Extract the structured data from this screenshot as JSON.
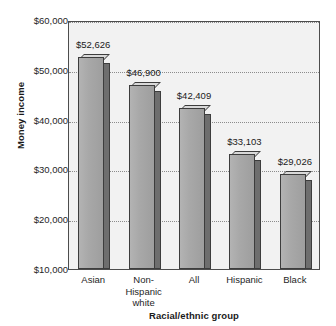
{
  "chart_data": {
    "type": "bar",
    "title": "",
    "subtitle": "",
    "xlabel": "Racial/ethnic group",
    "ylabel": "Money income",
    "categories": [
      "Asian",
      "Non-\nHispanic\nwhite",
      "All",
      "Hispanic",
      "Black"
    ],
    "category_labels_flat": [
      "Asian",
      "Non-Hispanic white",
      "All",
      "Hispanic",
      "Black"
    ],
    "values": [
      52626,
      46900,
      42409,
      33103,
      29026
    ],
    "data_labels": [
      "$52,626",
      "$46,900",
      "$42,409",
      "$33,103",
      "$29,026"
    ],
    "ylim": [
      10000,
      60000
    ],
    "ytick_values": [
      10000,
      20000,
      30000,
      40000,
      50000,
      60000
    ],
    "ytick_labels": [
      "$10,000",
      "$20,000",
      "$30,000",
      "$40,000",
      "$50,000",
      "$60,000"
    ],
    "grid": true,
    "grid_style": "dotted",
    "legend": "none",
    "bar_style": "3d",
    "colors": {
      "bar_front": "#a8a8a8",
      "bar_side": "#6e6e6e",
      "bar_top": "#d9d9d9",
      "bar_outline": "#3d3d3d",
      "plot_background": "#f2f2f2",
      "plot_border": "#4d4d4d",
      "gridline": "#8c8c8c",
      "text": "#1a1a1a",
      "page_background": "#ffffff"
    }
  }
}
